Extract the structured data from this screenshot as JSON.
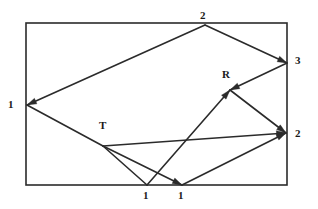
{
  "figure": {
    "kind": "directed-graph-diagram",
    "canvas": {
      "width": 318,
      "height": 209,
      "background": "#ffffff"
    },
    "stroke_color": "#2b2b2b",
    "label_color": "#1a1a1a",
    "frame": {
      "x": 26,
      "y": 23,
      "width": 261,
      "height": 162,
      "stroke_width": 1.6
    }
  },
  "nodes": [
    {
      "id": "n_left_1",
      "label": "1",
      "x": 27,
      "y": 105,
      "label_x": 8,
      "label_y": 99
    },
    {
      "id": "n_top_2",
      "label": "2",
      "x": 205,
      "y": 25,
      "label_x": 200,
      "label_y": 10
    },
    {
      "id": "n_right_3",
      "label": "3",
      "x": 287,
      "y": 63,
      "label_x": 295,
      "label_y": 55
    },
    {
      "id": "n_R",
      "label": "R",
      "x": 230,
      "y": 90,
      "label_x": 222,
      "label_y": 69
    },
    {
      "id": "n_T",
      "label": "T",
      "x": 103,
      "y": 146,
      "label_x": 99,
      "label_y": 120
    },
    {
      "id": "n_right_2",
      "label": "2",
      "x": 286,
      "y": 133,
      "label_x": 295,
      "label_y": 128
    },
    {
      "id": "n_bottom_1a",
      "label": "1",
      "x": 147,
      "y": 185,
      "label_x": 143,
      "label_y": 190
    },
    {
      "id": "n_bottom_1b",
      "label": "1",
      "x": 182,
      "y": 185,
      "label_x": 178,
      "label_y": 190
    }
  ],
  "edges": [
    {
      "id": "e1",
      "from": "n_top_2",
      "to": "n_left_1",
      "arrow_at_end": true
    },
    {
      "id": "e2",
      "from": "n_top_2",
      "to": "n_right_3",
      "arrow_at_end": true
    },
    {
      "id": "e3",
      "from": "n_left_1",
      "to": "n_T",
      "arrow_at_end": false
    },
    {
      "id": "e4",
      "from": "n_T",
      "to": "n_right_2",
      "arrow_at_end": true
    },
    {
      "id": "e5",
      "from": "n_right_3",
      "to": "n_R",
      "arrow_at_end": true
    },
    {
      "id": "e6",
      "from": "n_T",
      "to": "n_bottom_1a",
      "arrow_at_end": false
    },
    {
      "id": "e7",
      "from": "n_T",
      "to": "n_bottom_1b",
      "arrow_at_end": true
    },
    {
      "id": "e8",
      "from": "n_bottom_1a",
      "to": "n_R",
      "arrow_at_end": true
    },
    {
      "id": "e9",
      "from": "n_R",
      "to": "n_right_2",
      "arrow_at_end": true
    },
    {
      "id": "e10",
      "from": "n_bottom_1b",
      "to": "n_right_2",
      "arrow_at_end": true
    }
  ]
}
